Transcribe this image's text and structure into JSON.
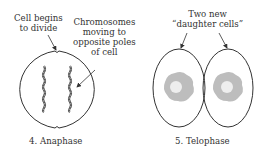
{
  "panels": [
    {
      "caption": "4.  Anaphase",
      "annotations": [
        {
          "lines": [
            "Cell begins",
            "to divide"
          ]
        },
        {
          "lines": [
            "Chromosomes",
            "moving to",
            "opposite poles",
            "of cell"
          ]
        }
      ]
    },
    {
      "caption": "5.  Telophase",
      "annotations": [
        {
          "lines": [
            "Two new",
            "“daughter cells”"
          ]
        }
      ]
    }
  ],
  "colors": {
    "outline": "#333333",
    "nucleus": "#bdbdbd",
    "nucleus_core": "#eeeeee"
  }
}
